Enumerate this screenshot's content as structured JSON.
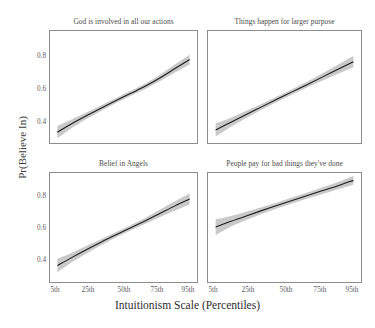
{
  "chart_data": {
    "type": "line",
    "title": "",
    "xlabel": "Intuitionism Scale (Percentiles)",
    "ylabel": "Pr(Believe In)",
    "grid": false,
    "legend": "none",
    "layout": "2x2 facet grid",
    "xlim": [
      0,
      100
    ],
    "ylim": [
      0.3,
      0.92
    ],
    "xtick_labels": [
      "5th",
      "25th",
      "50th",
      "75th",
      "95th"
    ],
    "xtick_values": [
      5,
      25,
      50,
      75,
      95
    ],
    "ytick_labels": [
      "0.4",
      "0.6",
      "0.8"
    ],
    "ytick_values": [
      0.4,
      0.6,
      0.8
    ],
    "band_color": "#c9c9c9",
    "line_color": "#1a1a1a",
    "band_label": "95% confidence interval",
    "panels": [
      {
        "title": "God is involved in all our actions",
        "x": [
          5,
          15,
          25,
          35,
          45,
          55,
          65,
          75,
          85,
          95
        ],
        "y": [
          0.36,
          0.408,
          0.452,
          0.494,
          0.535,
          0.575,
          0.615,
          0.661,
          0.712,
          0.762
        ],
        "y_lower": [
          0.326,
          0.385,
          0.434,
          0.479,
          0.521,
          0.561,
          0.6,
          0.643,
          0.69,
          0.735
        ],
        "y_upper": [
          0.394,
          0.431,
          0.47,
          0.509,
          0.549,
          0.589,
          0.63,
          0.679,
          0.734,
          0.789
        ]
      },
      {
        "title": "Things happen for larger purpose",
        "x": [
          5,
          15,
          25,
          35,
          45,
          55,
          65,
          75,
          85,
          95
        ],
        "y": [
          0.372,
          0.415,
          0.458,
          0.5,
          0.542,
          0.583,
          0.624,
          0.666,
          0.708,
          0.75
        ],
        "y_lower": [
          0.336,
          0.39,
          0.438,
          0.484,
          0.527,
          0.568,
          0.608,
          0.646,
          0.683,
          0.719
        ],
        "y_upper": [
          0.408,
          0.44,
          0.478,
          0.516,
          0.557,
          0.598,
          0.64,
          0.686,
          0.733,
          0.781
        ]
      },
      {
        "title": "Belief in Angels",
        "x": [
          5,
          15,
          25,
          35,
          45,
          55,
          65,
          75,
          85,
          95
        ],
        "y": [
          0.393,
          0.44,
          0.485,
          0.528,
          0.569,
          0.609,
          0.649,
          0.691,
          0.733,
          0.772
        ],
        "y_lower": [
          0.355,
          0.414,
          0.464,
          0.511,
          0.554,
          0.594,
          0.632,
          0.67,
          0.707,
          0.741
        ],
        "y_upper": [
          0.431,
          0.466,
          0.506,
          0.545,
          0.584,
          0.624,
          0.666,
          0.712,
          0.759,
          0.803
        ]
      },
      {
        "title": "People pay for bad things they've done",
        "x": [
          5,
          15,
          25,
          35,
          45,
          55,
          65,
          75,
          85,
          95
        ],
        "y": [
          0.612,
          0.645,
          0.676,
          0.706,
          0.735,
          0.764,
          0.792,
          0.82,
          0.848,
          0.878
        ],
        "y_lower": [
          0.568,
          0.615,
          0.653,
          0.687,
          0.718,
          0.747,
          0.775,
          0.801,
          0.827,
          0.853
        ],
        "y_upper": [
          0.656,
          0.675,
          0.699,
          0.725,
          0.752,
          0.781,
          0.809,
          0.839,
          0.869,
          0.903
        ]
      }
    ]
  },
  "axes": {
    "ylabel": "Pr(Believe In)",
    "xlabel": "Intuitionism Scale (Percentiles)",
    "yticks": [
      "0.8",
      "0.6",
      "0.4"
    ],
    "xticks": [
      "5th",
      "25th",
      "50th",
      "75th",
      "95th"
    ]
  },
  "panel_titles": {
    "p1": "God is involved in all our actions",
    "p2": "Things happen for larger purpose",
    "p3": "Belief in Angels",
    "p4": "People pay for bad things they've done"
  }
}
